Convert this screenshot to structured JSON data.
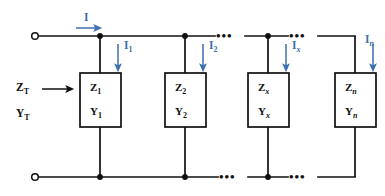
{
  "diagram": {
    "colors": {
      "wire": "#101010",
      "current_label": "#3b6fae",
      "box_stroke": "#101010",
      "background": "#ffffff"
    },
    "source_label": {
      "current": "I",
      "impedance": "Z",
      "impedance_sub": "T",
      "admittance": "Y",
      "admittance_sub": "T"
    },
    "branch_currents": [
      {
        "symbol": "I",
        "sub": "1",
        "italic_sub": false
      },
      {
        "symbol": "I",
        "sub": "2",
        "italic_sub": false
      },
      {
        "symbol": "I",
        "sub": "x",
        "italic_sub": true
      },
      {
        "symbol": "I",
        "sub": "n",
        "italic_sub": true
      }
    ],
    "branches": [
      {
        "z": "Z",
        "z_sub": "1",
        "y": "Y",
        "y_sub": "1",
        "italic_sub": false
      },
      {
        "z": "Z",
        "z_sub": "2",
        "y": "Y",
        "y_sub": "2",
        "italic_sub": false
      },
      {
        "z": "Z",
        "z_sub": "x",
        "y": "Y",
        "y_sub": "x",
        "italic_sub": true
      },
      {
        "z": "Z",
        "z_sub": "n",
        "y": "Y",
        "y_sub": "n",
        "italic_sub": true
      }
    ],
    "ellipsis": {
      "dots": "•••",
      "count": 3
    },
    "terminals": {
      "top_left": "open-terminal",
      "bottom_left": "open-terminal"
    }
  }
}
